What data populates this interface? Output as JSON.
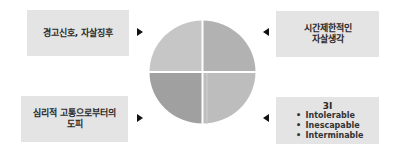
{
  "diagram": {
    "center": {
      "shape": "circle-4-quadrants",
      "quadrant_colors": {
        "top_left": "#c6c6c6",
        "top_right": "#b2b2b2",
        "bottom_left": "#a0a0a0",
        "bottom_right": "#bdbdbd"
      }
    },
    "boxes": {
      "top_left": {
        "lines": [
          "경고신호, 자살징후"
        ],
        "arrow": "right"
      },
      "top_right": {
        "lines": [
          "시간제한적인",
          "자살생각"
        ],
        "arrow": "left"
      },
      "bottom_left": {
        "lines": [
          "심리적 고통으로부터의",
          "도피"
        ],
        "arrow": "right"
      },
      "bottom_right": {
        "title": "3I",
        "bullet": "•",
        "items": [
          "Intolerable",
          "Inescapable",
          "Interminable"
        ],
        "arrow": "left"
      }
    },
    "colors": {
      "box_bg": "#e4e4e4",
      "text": "#2a2a2a",
      "arrow": "#111111"
    }
  }
}
